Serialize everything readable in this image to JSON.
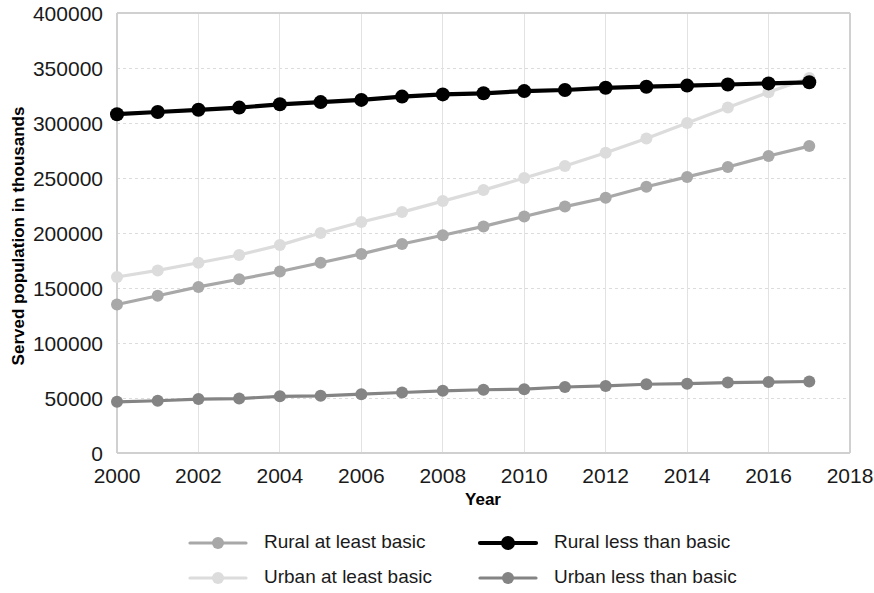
{
  "chart_data": {
    "type": "line",
    "title": "",
    "xlabel": "Year",
    "ylabel": "Served population in thousands",
    "x": [
      2000,
      2001,
      2002,
      2003,
      2004,
      2005,
      2006,
      2007,
      2008,
      2009,
      2010,
      2011,
      2012,
      2013,
      2014,
      2015,
      2016,
      2017
    ],
    "xlim": [
      2000,
      2018
    ],
    "ylim": [
      0,
      400000
    ],
    "xticks": [
      2000,
      2002,
      2004,
      2006,
      2008,
      2010,
      2012,
      2014,
      2016,
      2018
    ],
    "xtick_labels": [
      "2000",
      "2002",
      "2004",
      "2006",
      "2008",
      "2010",
      "2012",
      "2014",
      "2016",
      "2018"
    ],
    "yticks": [
      0,
      50000,
      100000,
      150000,
      200000,
      250000,
      300000,
      350000,
      400000
    ],
    "ytick_labels": [
      "0",
      "50000",
      "100000",
      "150000",
      "200000",
      "250000",
      "300000",
      "350000",
      "400000"
    ],
    "grid": true,
    "legend_position": "bottom",
    "series": [
      {
        "name": "Rural at least basic",
        "color": "#a8a8a8",
        "marker": "circle",
        "values": [
          135000,
          143000,
          151000,
          158000,
          165000,
          173000,
          181000,
          190000,
          198000,
          206000,
          215000,
          224000,
          232000,
          242000,
          251000,
          260000,
          270000,
          279000
        ]
      },
      {
        "name": "Rural less than basic",
        "color": "#000000",
        "marker": "circle",
        "values": [
          308000,
          310000,
          312000,
          314000,
          317000,
          319000,
          321000,
          324000,
          326000,
          327000,
          329000,
          330000,
          332000,
          333000,
          334000,
          335000,
          336000,
          337000
        ]
      },
      {
        "name": "Urban at least basic",
        "color": "#dcdcdc",
        "marker": "circle",
        "values": [
          160000,
          166000,
          173000,
          180000,
          189000,
          200000,
          210000,
          219000,
          229000,
          239000,
          250000,
          261000,
          273000,
          286000,
          300000,
          314000,
          328000,
          341000
        ]
      },
      {
        "name": "Urban less than basic",
        "color": "#848484",
        "marker": "circle",
        "values": [
          46500,
          47500,
          49000,
          49500,
          51500,
          52000,
          53500,
          55000,
          56500,
          57500,
          58000,
          60000,
          61000,
          62500,
          63000,
          64000,
          64500,
          65000
        ]
      }
    ],
    "legend_entries": [
      {
        "label": "Rural at least basic",
        "color": "#a8a8a8"
      },
      {
        "label": "Rural less than basic",
        "color": "#000000"
      },
      {
        "label": "Urban at least basic",
        "color": "#dcdcdc"
      },
      {
        "label": "Urban less than basic",
        "color": "#848484"
      }
    ]
  }
}
